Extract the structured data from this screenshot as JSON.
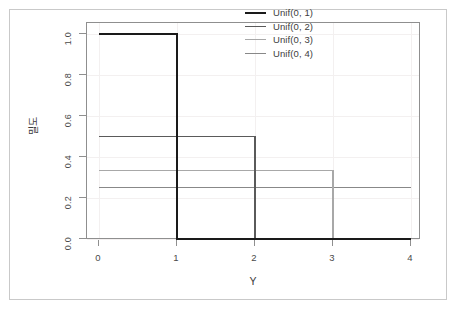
{
  "chart_data": {
    "type": "line",
    "title": "",
    "xlabel": "Y",
    "ylabel": "밀도",
    "xlim": [
      0,
      4
    ],
    "ylim": [
      0.0,
      1.0
    ],
    "xticks": [
      0,
      1,
      2,
      3,
      4
    ],
    "xtick_labels": [
      "0",
      "1",
      "2",
      "3",
      "4"
    ],
    "yticks": [
      0.0,
      0.2,
      0.4,
      0.6,
      0.8,
      1.0
    ],
    "ytick_labels": [
      "0.0",
      "0.2",
      "0.4",
      "0.6",
      "0.8",
      "1.0"
    ],
    "grid": true,
    "legend_position": "top-right",
    "series": [
      {
        "name": "Unif(0, 1)",
        "color": "#1a1a1a",
        "width": 2.0,
        "density_height": 1.0,
        "support_end": 1,
        "x": [
          0,
          1,
          1,
          4
        ],
        "values": [
          1.0,
          1.0,
          0.0,
          0.0
        ]
      },
      {
        "name": "Unif(0, 2)",
        "color": "#5a5a5a",
        "width": 1.6,
        "density_height": 0.5,
        "support_end": 2,
        "x": [
          0,
          2,
          2,
          4
        ],
        "values": [
          0.5,
          0.5,
          0.0,
          0.0
        ]
      },
      {
        "name": "Unif(0, 3)",
        "color": "#a8a8a8",
        "width": 1.2,
        "density_height": 0.333,
        "support_end": 3,
        "x": [
          0,
          3,
          3,
          4
        ],
        "values": [
          0.333,
          0.333,
          0.0,
          0.0
        ]
      },
      {
        "name": "Unif(0, 4)",
        "color": "#888888",
        "width": 1.2,
        "density_height": 0.25,
        "support_end": 4,
        "x": [
          0,
          4
        ],
        "values": [
          0.25,
          0.25
        ]
      }
    ]
  },
  "legend": {
    "entries": [
      {
        "label": "Unif(0, 1)"
      },
      {
        "label": "Unif(0, 2)"
      },
      {
        "label": "Unif(0, 3)"
      },
      {
        "label": "Unif(0, 4)"
      }
    ]
  },
  "axes": {
    "x_title": "Y",
    "y_title": "밀도"
  }
}
